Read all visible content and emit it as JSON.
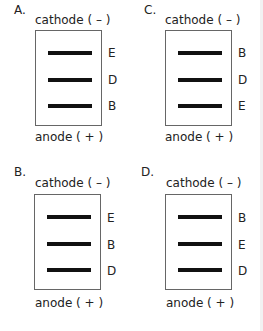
{
  "figure": {
    "panels": [
      {
        "id": "A",
        "label": "A.",
        "cathode_label": "cathode ( – )",
        "anode_label": "anode ( + )",
        "bands": [
          "E",
          "D",
          "B"
        ]
      },
      {
        "id": "C",
        "label": "C.",
        "cathode_label": "cathode ( – )",
        "anode_label": "anode ( + )",
        "bands": [
          "B",
          "D",
          "E"
        ]
      },
      {
        "id": "B",
        "label": "B.",
        "cathode_label": "cathode ( – )",
        "anode_label": "anode ( + )",
        "bands": [
          "E",
          "B",
          "D"
        ]
      },
      {
        "id": "D",
        "label": "D.",
        "cathode_label": "cathode ( – )",
        "anode_label": "anode ( + )",
        "bands": [
          "B",
          "E",
          "D"
        ]
      }
    ],
    "colors": {
      "band": "#111111",
      "border": "#666666",
      "background": "#ffffff"
    }
  }
}
